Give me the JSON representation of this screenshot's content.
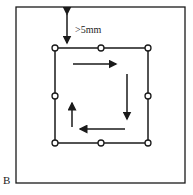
{
  "diagram": {
    "panel_label": "B",
    "distance_label": ">5mm",
    "colors": {
      "stroke": "#1a1a1a",
      "background": "#ffffff"
    },
    "electrode_points": 8,
    "flow_direction": "clockwise"
  }
}
